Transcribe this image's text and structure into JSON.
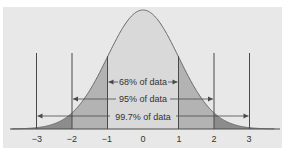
{
  "chart_data": {
    "type": "area",
    "title": "",
    "subtitle": "",
    "xlabel": "",
    "ylabel": "",
    "x_ticks": [
      "−3",
      "−2",
      "−1",
      "0",
      "1",
      "2",
      "3"
    ],
    "x_tick_values": [
      -3,
      -2,
      -1,
      0,
      1,
      2,
      3
    ],
    "xlim": [
      -4,
      4
    ],
    "grid": false,
    "legend": null,
    "regions": [
      {
        "range": [
          -1,
          1
        ],
        "label": "68% of data",
        "percent": 68,
        "shade": "light"
      },
      {
        "range": [
          -2,
          2
        ],
        "label": "95% of data",
        "percent": 95,
        "shade": "medium"
      },
      {
        "range": [
          -3,
          3
        ],
        "label": "99.7% of data",
        "percent": 99.7,
        "shade": "dark"
      }
    ],
    "curve": {
      "mean": 0,
      "sd": 1,
      "kind": "normal"
    }
  },
  "labels": {
    "region_68": "68% of data",
    "region_95": "95% of data",
    "region_997": "99.7% of data"
  },
  "colors": {
    "page_background": "#ffffff",
    "panel_background": "#e8e8e8",
    "center_fill": "#d9d9d9",
    "sd1_2_fill": "#b3b3b3",
    "sd2_3_fill": "#8c8c8c",
    "curve_stroke": "#6e6e6e",
    "line_stroke": "#4a4a4a",
    "text": "#333333"
  }
}
